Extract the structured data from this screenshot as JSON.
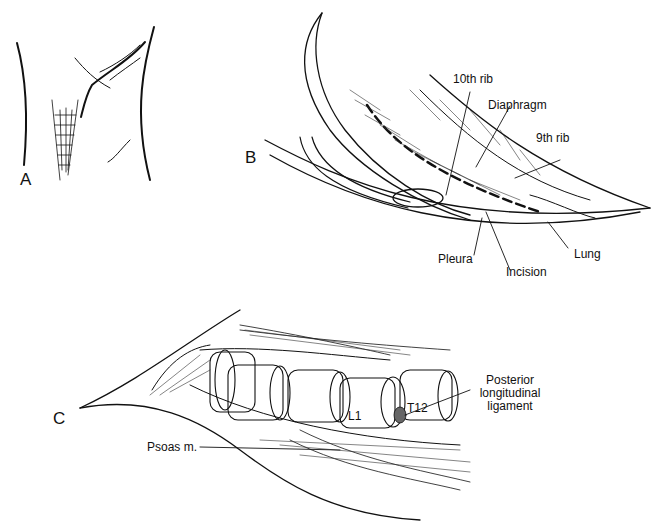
{
  "figure": {
    "panels": [
      {
        "id": "A",
        "letter": "A",
        "description": "Patient flank position sketch"
      },
      {
        "id": "B",
        "letter": "B",
        "description": "Thoracoabdominal incision exposure"
      },
      {
        "id": "C",
        "letter": "C",
        "description": "Exposed thoracolumbar vertebrae"
      }
    ],
    "labels_b": {
      "rib10": "10th rib",
      "diaphragm": "Diaphragm",
      "rib9": "9th rib",
      "pleura": "Pleura",
      "incision": "Incision",
      "lung": "Lung"
    },
    "labels_c": {
      "l1": "L1",
      "t12": "T12",
      "pll_line1": "Posterior",
      "pll_line2": "longitudinal",
      "pll_line3": "ligament",
      "psoas": "Psoas m."
    }
  }
}
